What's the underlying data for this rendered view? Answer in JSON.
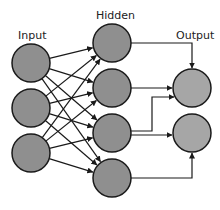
{
  "diagram": {
    "labels": {
      "input": "Input",
      "hidden": "Hidden",
      "output": "Output"
    },
    "colors": {
      "node_fill": "#8f8f8f",
      "output_fill": "#a6a6a6",
      "stroke": "#1a1a1a",
      "edge": "#1a1a1a"
    },
    "layers": {
      "input": [
        {
          "cx": 31,
          "cy": 63
        },
        {
          "cx": 31,
          "cy": 108
        },
        {
          "cx": 31,
          "cy": 153
        }
      ],
      "hidden": [
        {
          "cx": 112,
          "cy": 43
        },
        {
          "cx": 112,
          "cy": 88
        },
        {
          "cx": 112,
          "cy": 133
        },
        {
          "cx": 112,
          "cy": 178
        }
      ],
      "output": [
        {
          "cx": 192,
          "cy": 88
        },
        {
          "cx": 192,
          "cy": 133
        }
      ]
    },
    "node_radius": 19,
    "edges_input_hidden": "fully-connected",
    "edges_hidden_output": [
      {
        "from": "hidden-1",
        "to": "output-1",
        "route": "elbow-down"
      },
      {
        "from": "hidden-2",
        "to": "output-1",
        "route": "straight"
      },
      {
        "from": "hidden-3",
        "to": "output-1",
        "route": "elbow-up"
      },
      {
        "from": "hidden-3",
        "to": "output-2",
        "route": "straight"
      },
      {
        "from": "hidden-4",
        "to": "output-2",
        "route": "elbow-up"
      }
    ]
  }
}
